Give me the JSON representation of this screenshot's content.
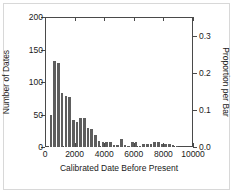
{
  "chart_data": {
    "type": "bar",
    "title": "",
    "subtitle": "",
    "xlabel": "Calibrated Date Before Present",
    "ylabel": "Number of Dates",
    "ylabel_right": "Proportion per Bar",
    "xlim": [
      0,
      10000
    ],
    "ylim": [
      0,
      200
    ],
    "ylim_right": [
      0.0,
      0.35
    ],
    "grid": false,
    "legend": null,
    "bin_width": 250,
    "bar_color": "#5e5e5e",
    "xticks": [
      0,
      2000,
      4000,
      6000,
      8000,
      10000
    ],
    "xticklabels": [
      "0",
      "2000",
      "4000",
      "6000",
      "8000",
      "10000"
    ],
    "yticks": [
      0,
      50,
      100,
      150,
      200
    ],
    "yticklabels": [
      "0",
      "50",
      "100",
      "150",
      "200"
    ],
    "yticks_right": [
      0.0,
      0.1,
      0.2,
      0.3
    ],
    "yticklabels_right": [
      "0.0",
      "0.1",
      "0.2",
      "0.3"
    ],
    "bin_starts": [
      250,
      500,
      750,
      1000,
      1250,
      1500,
      1750,
      2000,
      2250,
      2500,
      2750,
      3000,
      3250,
      3500,
      3750,
      4000,
      4250,
      4500,
      4750,
      5000,
      5250,
      5500,
      5750,
      6000,
      6250,
      6500,
      6750,
      7000,
      7250,
      7500,
      7750,
      8000,
      8250,
      8500,
      8750
    ],
    "values": [
      50,
      133,
      130,
      83,
      78,
      77,
      41,
      39,
      45,
      44,
      29,
      28,
      18,
      9,
      8,
      8,
      8,
      3,
      3,
      12,
      3,
      2,
      7,
      7,
      2,
      5,
      5,
      4,
      7,
      8,
      5,
      5,
      4,
      3,
      2
    ]
  },
  "axis_titles": {
    "left": "Number of Dates",
    "right": "Proportion per Bar",
    "bottom": "Calibrated Date Before Present"
  }
}
